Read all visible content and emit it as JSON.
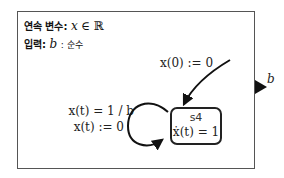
{
  "declarations": {
    "continuous": {
      "keyword": "연속 변수",
      "separator": ":",
      "variable": "x",
      "relation": "∈",
      "set": "ℝ"
    },
    "input": {
      "keyword": "입력",
      "separator": ":",
      "variable": "b",
      "type_separator": ":",
      "type": "순수"
    }
  },
  "initial_transition": {
    "label": "x(0) := 0"
  },
  "self_transition": {
    "guard": "x(t) = 1 / b",
    "reset": "x(t) := 0"
  },
  "state": {
    "name": "s4",
    "dynamics": "ẋ(t) = 1"
  },
  "input_port": {
    "label": "b"
  },
  "colors": {
    "stroke": "#222222",
    "frame": "#555555",
    "background": "#ffffff"
  }
}
